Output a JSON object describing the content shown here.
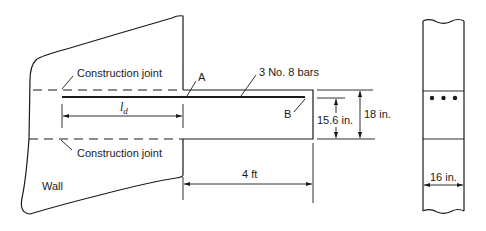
{
  "diagram": {
    "labels": {
      "construction_joint_top": "Construction joint",
      "construction_joint_bottom": "Construction joint",
      "point_a": "A",
      "point_b": "B",
      "bars": "3 No. 8 bars",
      "ld_symbol": "l",
      "ld_subscript": "d",
      "wall": "Wall",
      "depth_effective": "15.6 in.",
      "depth_total": "18 in.",
      "length": "4 ft",
      "width": "16 in."
    },
    "views": [
      "elevation",
      "cross-section"
    ],
    "section_bar_count": 3,
    "colors": {
      "line": "#1a1a1a",
      "background": "#ffffff"
    }
  }
}
